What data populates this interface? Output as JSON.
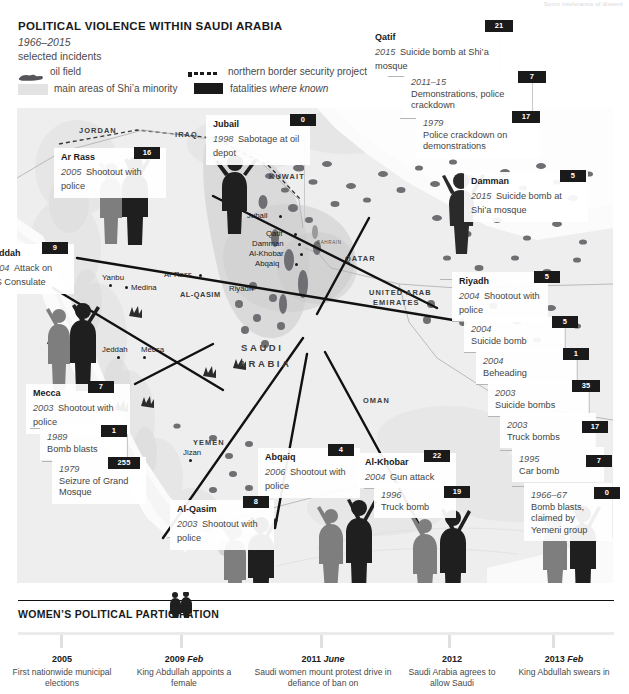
{
  "header": {
    "title": "POLITICAL VIOLENCE WITHIN SAUDI ARABIA",
    "years": "1966–2015",
    "subtitle": "selected incidents",
    "topnote": "Sunni intolerance of dissent"
  },
  "legend": {
    "oil_field": "oil field",
    "shia_areas": "main areas of Shi’a minority",
    "border_project": "northern border security project",
    "fatalities": "fatalities ",
    "fatalities_em": "where known"
  },
  "map": {
    "countries": [
      "JORDAN",
      "IRAQ",
      "KUWAIT",
      "QATAR",
      "BAHRAIN",
      "UNITED ARAB",
      "EMIRATES",
      "OMAN",
      "YEMEN"
    ],
    "country_main": [
      "SAUDI",
      "ARABIA"
    ],
    "region": "AL-QASIM",
    "sea": "Red Sea",
    "cities": [
      "Jubail",
      "Qatif",
      "Damman",
      "Al-Khobar",
      "Abqaiq",
      "Riyadh",
      "Ar Rass",
      "Yanbu",
      "Medina",
      "Jeddah",
      "Mecca",
      "Jizan"
    ]
  },
  "incidents": [
    {
      "id": "jubail",
      "title": "Jubail",
      "year": "1998",
      "desc": "Sabotage at oil depot",
      "fatalities": "0"
    },
    {
      "id": "qatif",
      "title": "Qatif",
      "year": "2015",
      "desc": "Suicide bomb at Shi’a mosque",
      "fatalities": "21"
    },
    {
      "id": "qatif2",
      "title": "",
      "year": "2011–15",
      "desc": "Demonstrations, police crackdown",
      "fatalities": "7"
    },
    {
      "id": "qatif3",
      "title": "",
      "year": "1979",
      "desc": "Police crackdown on demonstrations",
      "fatalities": "17"
    },
    {
      "id": "arrass",
      "title": "Ar Rass",
      "year": "2005",
      "desc": "Shootout with police",
      "fatalities": "16"
    },
    {
      "id": "damman",
      "title": "Damman",
      "year": "2015",
      "desc": "Suicide bomb at Shi’a mosque",
      "fatalities": "5"
    },
    {
      "id": "jeddah",
      "title": "Jeddah",
      "year": "2004",
      "desc": "Attack on US Consulate",
      "fatalities": "9"
    },
    {
      "id": "riyadh",
      "title": "Riyadh",
      "year": "2004",
      "desc": "Shootout with police",
      "fatalities": "5"
    },
    {
      "id": "riyadh2",
      "title": "",
      "year": "2004",
      "desc": "Suicide bomb",
      "fatalities": "5"
    },
    {
      "id": "riyadh3",
      "title": "",
      "year": "2004",
      "desc": "Beheading",
      "fatalities": "1"
    },
    {
      "id": "riyadh4",
      "title": "",
      "year": "2003",
      "desc": "Suicide bombs",
      "fatalities": "35"
    },
    {
      "id": "riyadh5",
      "title": "",
      "year": "2003",
      "desc": "Truck bombs",
      "fatalities": "17"
    },
    {
      "id": "riyadh6",
      "title": "",
      "year": "1995",
      "desc": "Car bomb",
      "fatalities": "7"
    },
    {
      "id": "riyadh7",
      "title": "",
      "year": "1966–67",
      "desc": "Bomb blasts, claimed by Yemeni group",
      "fatalities": "0"
    },
    {
      "id": "mecca",
      "title": "Mecca",
      "year": "2003",
      "desc": "Shootout with police",
      "fatalities": "7"
    },
    {
      "id": "mecca2",
      "title": "",
      "year": "1989",
      "desc": "Bomb blasts",
      "fatalities": "1"
    },
    {
      "id": "mecca3",
      "title": "",
      "year": "1979",
      "desc": "Seizure of Grand Mosque",
      "fatalities": "255"
    },
    {
      "id": "alqasim",
      "title": "Al-Qasim",
      "year": "2003",
      "desc": "Shootout with police",
      "fatalities": "8"
    },
    {
      "id": "abqaiq",
      "title": "Abqaiq",
      "year": "2006",
      "desc": "Shootout with police",
      "fatalities": "4"
    },
    {
      "id": "alkhobar",
      "title": "Al-Khobar",
      "year": "2004",
      "desc": "Gun attack",
      "fatalities": "22"
    },
    {
      "id": "alkhobar2",
      "title": "",
      "year": "1996",
      "desc": "Truck bomb",
      "fatalities": "19"
    }
  ],
  "bottom": {
    "title": "WOMEN’S POLITICAL PARTICIPATION",
    "timeline": [
      {
        "year": "2005",
        "month": "",
        "desc": "First nationwide municipal elections"
      },
      {
        "year": "2009",
        "month": "Feb",
        "desc": "King Abdullah appoints a female"
      },
      {
        "year": "2011",
        "month": "June",
        "desc": "Saudi women mount protest drive in defiance of ban on"
      },
      {
        "year": "2012",
        "month": "",
        "desc": "Saudi Arabia agrees to allow Saudi"
      },
      {
        "year": "2013",
        "month": "Feb",
        "desc": "King Abdullah swears in"
      }
    ]
  },
  "colors": {
    "ink": "#1a1a1a",
    "land": "#efefef",
    "shia": "#d2d2d2",
    "water": "#fcfcfc",
    "badge_bg": "#1a1a1a"
  }
}
